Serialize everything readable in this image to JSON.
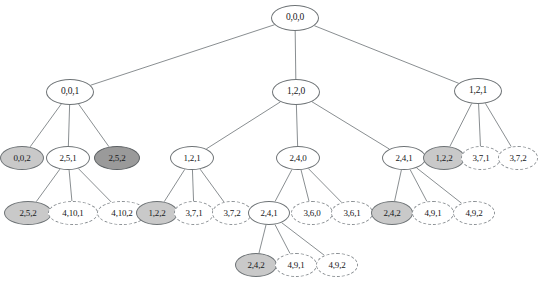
{
  "figure": {
    "type": "tree-diagram",
    "width": 538,
    "height": 290,
    "background": "#ffffff",
    "styles": {
      "plain": {
        "fill": "#ffffff",
        "stroke": "#6e7376",
        "stroke_style": "solid"
      },
      "light_gray": {
        "fill": "#c9c9c9",
        "stroke": "#6e7376",
        "stroke_style": "solid"
      },
      "dark_gray": {
        "fill": "#9a9a9a",
        "stroke": "#5c6063",
        "stroke_style": "solid"
      },
      "dashed": {
        "fill": "#ffffff",
        "stroke": "#8b9094",
        "stroke_style": "dashed"
      }
    },
    "edge_color": "#7c8184"
  },
  "nodes": [
    {
      "id": "n0",
      "label": "0,0,0",
      "x": 295,
      "y": 18,
      "rx": 24,
      "ry": 13,
      "style": "plain",
      "level": 0
    },
    {
      "id": "n1",
      "label": "0,0,1",
      "x": 70,
      "y": 92,
      "rx": 24,
      "ry": 13,
      "style": "plain",
      "level": 1
    },
    {
      "id": "n2",
      "label": "1,2,0",
      "x": 296,
      "y": 92,
      "rx": 24,
      "ry": 13,
      "style": "plain",
      "level": 1
    },
    {
      "id": "n3",
      "label": "1,2,1",
      "x": 478,
      "y": 91,
      "rx": 24,
      "ry": 13,
      "style": "plain",
      "level": 1
    },
    {
      "id": "n4",
      "label": "0,0,2",
      "x": 22,
      "y": 158,
      "rx": 22,
      "ry": 12,
      "style": "light_gray",
      "level": 2
    },
    {
      "id": "n5",
      "label": "2,5,1",
      "x": 68,
      "y": 158,
      "rx": 22,
      "ry": 12,
      "style": "plain",
      "level": 2
    },
    {
      "id": "n6",
      "label": "2,5,2",
      "x": 117,
      "y": 158,
      "rx": 23,
      "ry": 12,
      "style": "dark_gray",
      "level": 2
    },
    {
      "id": "n7",
      "label": "1,2,1",
      "x": 192,
      "y": 158,
      "rx": 22,
      "ry": 12,
      "style": "plain",
      "level": 2
    },
    {
      "id": "n8",
      "label": "2,4,0",
      "x": 298,
      "y": 158,
      "rx": 22,
      "ry": 12,
      "style": "plain",
      "level": 2
    },
    {
      "id": "n9",
      "label": "2,4,1",
      "x": 404,
      "y": 158,
      "rx": 22,
      "ry": 12,
      "style": "plain",
      "level": 2
    },
    {
      "id": "n10",
      "label": "1,2,2",
      "x": 444,
      "y": 158,
      "rx": 21,
      "ry": 12,
      "style": "light_gray",
      "level": 2
    },
    {
      "id": "n11",
      "label": "3,7,1",
      "x": 481,
      "y": 158,
      "rx": 20,
      "ry": 12,
      "style": "dashed",
      "level": 2
    },
    {
      "id": "n12",
      "label": "3,7,2",
      "x": 518,
      "y": 158,
      "rx": 20,
      "ry": 12,
      "style": "dashed",
      "level": 2
    },
    {
      "id": "n13",
      "label": "2,5,2",
      "x": 28,
      "y": 213,
      "rx": 24,
      "ry": 12,
      "style": "light_gray",
      "level": 3
    },
    {
      "id": "n14",
      "label": "4,10,1",
      "x": 73,
      "y": 213,
      "rx": 25,
      "ry": 12,
      "style": "dashed",
      "level": 3
    },
    {
      "id": "n15",
      "label": "4,10,2",
      "x": 122,
      "y": 213,
      "rx": 25,
      "ry": 12,
      "style": "dashed",
      "level": 3
    },
    {
      "id": "n16",
      "label": "1,2,2",
      "x": 157,
      "y": 213,
      "rx": 21,
      "ry": 12,
      "style": "light_gray",
      "level": 3
    },
    {
      "id": "n17",
      "label": "3,7,1",
      "x": 194,
      "y": 213,
      "rx": 20,
      "ry": 12,
      "style": "dashed",
      "level": 3
    },
    {
      "id": "n18",
      "label": "3,7,2",
      "x": 232,
      "y": 213,
      "rx": 20,
      "ry": 12,
      "style": "dashed",
      "level": 3
    },
    {
      "id": "n19",
      "label": "2,4,1",
      "x": 269,
      "y": 213,
      "rx": 21,
      "ry": 12,
      "style": "plain",
      "level": 3
    },
    {
      "id": "n20",
      "label": "3,6,0",
      "x": 312,
      "y": 213,
      "rx": 21,
      "ry": 12,
      "style": "dashed",
      "level": 3
    },
    {
      "id": "n21",
      "label": "3,6,1",
      "x": 352,
      "y": 213,
      "rx": 21,
      "ry": 12,
      "style": "dashed",
      "level": 3
    },
    {
      "id": "n22",
      "label": "2,4,2",
      "x": 392,
      "y": 213,
      "rx": 21,
      "ry": 12,
      "style": "light_gray",
      "level": 3
    },
    {
      "id": "n23",
      "label": "4,9,1",
      "x": 433,
      "y": 213,
      "rx": 21,
      "ry": 12,
      "style": "dashed",
      "level": 3
    },
    {
      "id": "n24",
      "label": "4,9,2",
      "x": 474,
      "y": 213,
      "rx": 21,
      "ry": 12,
      "style": "dashed",
      "level": 3
    },
    {
      "id": "n25",
      "label": "2,4,2",
      "x": 256,
      "y": 265,
      "rx": 21,
      "ry": 12,
      "style": "light_gray",
      "level": 4
    },
    {
      "id": "n26",
      "label": "4,9,1",
      "x": 296,
      "y": 265,
      "rx": 21,
      "ry": 12,
      "style": "dashed",
      "level": 4
    },
    {
      "id": "n27",
      "label": "4,9,2",
      "x": 337,
      "y": 265,
      "rx": 21,
      "ry": 12,
      "style": "dashed",
      "level": 4
    }
  ],
  "edges": [
    {
      "from": "n0",
      "to": "n1"
    },
    {
      "from": "n0",
      "to": "n2"
    },
    {
      "from": "n0",
      "to": "n3"
    },
    {
      "from": "n1",
      "to": "n4"
    },
    {
      "from": "n1",
      "to": "n5"
    },
    {
      "from": "n1",
      "to": "n6"
    },
    {
      "from": "n2",
      "to": "n7"
    },
    {
      "from": "n2",
      "to": "n8"
    },
    {
      "from": "n2",
      "to": "n9"
    },
    {
      "from": "n3",
      "to": "n10"
    },
    {
      "from": "n3",
      "to": "n11"
    },
    {
      "from": "n3",
      "to": "n12"
    },
    {
      "from": "n5",
      "to": "n13"
    },
    {
      "from": "n5",
      "to": "n14"
    },
    {
      "from": "n5",
      "to": "n15"
    },
    {
      "from": "n7",
      "to": "n16"
    },
    {
      "from": "n7",
      "to": "n17"
    },
    {
      "from": "n7",
      "to": "n18"
    },
    {
      "from": "n8",
      "to": "n19"
    },
    {
      "from": "n8",
      "to": "n20"
    },
    {
      "from": "n8",
      "to": "n21"
    },
    {
      "from": "n9",
      "to": "n22"
    },
    {
      "from": "n9",
      "to": "n23"
    },
    {
      "from": "n9",
      "to": "n24"
    },
    {
      "from": "n19",
      "to": "n25"
    },
    {
      "from": "n19",
      "to": "n26"
    },
    {
      "from": "n19",
      "to": "n27"
    }
  ]
}
